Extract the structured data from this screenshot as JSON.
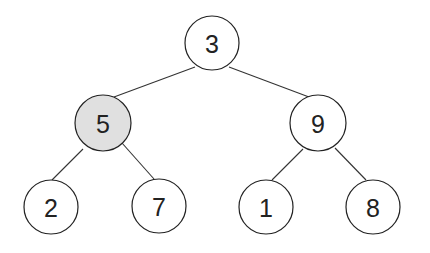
{
  "diagram": {
    "type": "binary-tree",
    "colors": {
      "default_fill": "#ffffff",
      "highlight_fill": "#e0e0e0",
      "stroke": "#222222"
    },
    "nodes": [
      {
        "id": "n3",
        "label": "3",
        "cx": 212,
        "cy": 43,
        "highlighted": false
      },
      {
        "id": "n5",
        "label": "5",
        "cx": 103,
        "cy": 123,
        "highlighted": true
      },
      {
        "id": "n9",
        "label": "9",
        "cx": 318,
        "cy": 123,
        "highlighted": false
      },
      {
        "id": "n2",
        "label": "2",
        "cx": 51,
        "cy": 207,
        "highlighted": false
      },
      {
        "id": "n7",
        "label": "7",
        "cx": 159,
        "cy": 206,
        "highlighted": false
      },
      {
        "id": "n1",
        "label": "1",
        "cx": 266,
        "cy": 207,
        "highlighted": false
      },
      {
        "id": "n8",
        "label": "8",
        "cx": 373,
        "cy": 207,
        "highlighted": false
      }
    ],
    "edges": [
      {
        "from": "n3",
        "to": "n5"
      },
      {
        "from": "n3",
        "to": "n9"
      },
      {
        "from": "n5",
        "to": "n2"
      },
      {
        "from": "n5",
        "to": "n7"
      },
      {
        "from": "n9",
        "to": "n1"
      },
      {
        "from": "n9",
        "to": "n8"
      }
    ]
  }
}
